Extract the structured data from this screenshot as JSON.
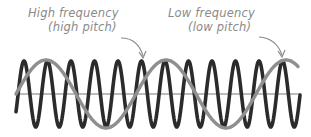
{
  "annotations": {
    "high": {
      "line1": "High frequency",
      "line2": "(high pitch)"
    },
    "low": {
      "line1": "Low frequency",
      "line2": "(low pitch)"
    }
  },
  "colors": {
    "high_wave": "#2b2b2b",
    "low_wave": "#8f8f8f",
    "baseline": "#7a7a7a",
    "label_text": "#8a8a8a",
    "background": "#ffffff"
  },
  "waves": {
    "high_frequency": {
      "cycles": 12,
      "first_peak_x": 24,
      "peak_spacing_px": 23.5
    },
    "low_frequency": {
      "cycles": 2.35,
      "period_px": 120
    }
  }
}
